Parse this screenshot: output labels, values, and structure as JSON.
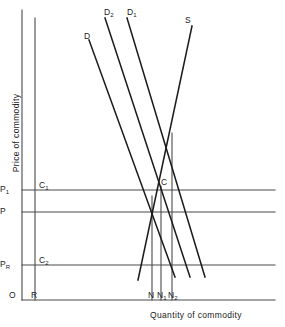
{
  "figure": {
    "axes": {
      "xlabel": "Quantity of commodity",
      "ylabel": "Price of commodity",
      "origin_label": "O"
    },
    "y_tick_labels": [
      {
        "id": "p1",
        "text": "P",
        "sub": "1",
        "y": 190
      },
      {
        "id": "p",
        "text": "P",
        "sub": "",
        "y": 212
      },
      {
        "id": "pr",
        "text": "P",
        "sub": "R",
        "y": 265
      }
    ],
    "x_tick_labels": [
      {
        "id": "r",
        "text": "R",
        "sub": "",
        "x": 35
      },
      {
        "id": "n",
        "text": "N",
        "sub": "",
        "x": 152
      },
      {
        "id": "n1",
        "text": "N",
        "sub": "1",
        "x": 161
      },
      {
        "id": "n2",
        "text": "N",
        "sub": "2",
        "x": 172
      }
    ],
    "curve_labels": [
      {
        "id": "d",
        "text": "D",
        "sub": "",
        "x": 84,
        "y": 32
      },
      {
        "id": "d2",
        "text": "D",
        "sub": "2",
        "x": 104,
        "y": 8
      },
      {
        "id": "d1",
        "text": "D",
        "sub": "1",
        "x": 127,
        "y": 8
      },
      {
        "id": "s",
        "text": "S",
        "sub": "",
        "x": 185,
        "y": 16
      }
    ],
    "point_labels": [
      {
        "id": "c1",
        "text": "C",
        "sub": "1",
        "x": 39,
        "y": 181
      },
      {
        "id": "c",
        "text": "C",
        "sub": "",
        "x": 161,
        "y": 178
      },
      {
        "id": "c2",
        "text": "C",
        "sub": "2",
        "x": 39,
        "y": 256
      }
    ],
    "colors": {
      "ink": "#1a1a1a",
      "line": "#4a4a4a",
      "background": "#ffffff"
    }
  },
  "chart_data": {
    "type": "line",
    "title": "",
    "xlabel": "Quantity of commodity",
    "ylabel": "Price of commodity",
    "grid": false,
    "legend": "none",
    "xlim": [
      0,
      285
    ],
    "ylim": [
      0,
      327
    ],
    "axis_lines": [
      {
        "name": "y-axis",
        "x1": 22,
        "y1": 10,
        "x2": 22,
        "y2": 300
      },
      {
        "name": "x-axis",
        "x1": 22,
        "y1": 300,
        "x2": 275,
        "y2": 300
      },
      {
        "name": "r-vertical",
        "x1": 35,
        "y1": 18,
        "x2": 35,
        "y2": 300
      }
    ],
    "price_lines": [
      {
        "name": "P1-line",
        "price_label": "P1",
        "y": 190,
        "x1": 22,
        "x2": 275
      },
      {
        "name": "P-line",
        "price_label": "P",
        "y": 212,
        "x1": 22,
        "x2": 275
      },
      {
        "name": "PR-line",
        "price_label": "PR",
        "y": 265,
        "x1": 22,
        "x2": 275
      }
    ],
    "quantity_lines": [
      {
        "name": "N-vertical",
        "x": 152,
        "y1": 196,
        "y2": 300
      },
      {
        "name": "N1-vertical",
        "x": 161,
        "y1": 186,
        "y2": 300
      },
      {
        "name": "N2-vertical",
        "x": 172,
        "y1": 133,
        "y2": 300
      }
    ],
    "series": [
      {
        "name": "D",
        "type": "demand",
        "x1": 89,
        "y1": 40,
        "x2": 175,
        "y2": 277
      },
      {
        "name": "D2",
        "type": "demand",
        "x1": 105,
        "y1": 18,
        "x2": 190,
        "y2": 277
      },
      {
        "name": "D1",
        "type": "demand",
        "x1": 127,
        "y1": 18,
        "x2": 205,
        "y2": 277
      },
      {
        "name": "S",
        "type": "supply",
        "x1": 138,
        "y1": 280,
        "x2": 192,
        "y2": 26
      }
    ],
    "intersections": [
      {
        "name": "C",
        "x": 161,
        "y": 190,
        "note": "D1 x S at price P1, quantity N1"
      },
      {
        "name": "C1",
        "x": 35,
        "y": 190,
        "note": "P1 on R line"
      },
      {
        "name": "C2",
        "x": 35,
        "y": 265,
        "note": "PR on R line"
      },
      {
        "name": "E",
        "x": 152,
        "y": 212,
        "note": "D x S at price P, quantity N"
      },
      {
        "name": "F",
        "x": 172,
        "y": 133,
        "note": "D2 x S upper intersection"
      }
    ]
  }
}
